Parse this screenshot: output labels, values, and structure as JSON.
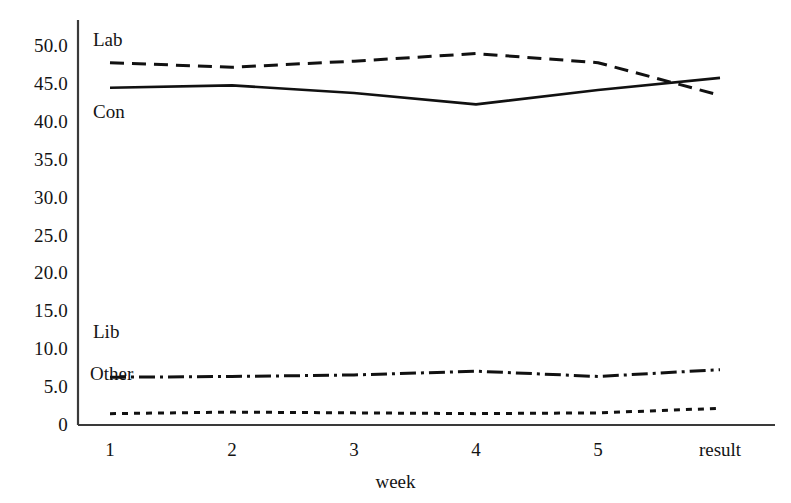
{
  "chart_data": {
    "type": "line",
    "title": "",
    "xlabel": "week",
    "ylabel": "",
    "categories": [
      "1",
      "2",
      "3",
      "4",
      "5",
      "result"
    ],
    "ylim": [
      0,
      50
    ],
    "yticks": [
      "0",
      "5.0",
      "10.0",
      "15.0",
      "20.0",
      "25.0",
      "30.0",
      "35.0",
      "40.0",
      "45.0",
      "50.0"
    ],
    "ytick_values": [
      0,
      5,
      10,
      15,
      20,
      25,
      30,
      35,
      40,
      45,
      50
    ],
    "grid": false,
    "legend_position": "inline-labels",
    "series": [
      {
        "name": "Lab",
        "style": "dashed",
        "color": "#111111",
        "values": [
          47.8,
          47.2,
          48.0,
          49.0,
          47.8,
          43.5
        ]
      },
      {
        "name": "Con",
        "style": "solid",
        "color": "#111111",
        "values": [
          44.5,
          44.8,
          43.8,
          42.3,
          44.2,
          45.8
        ]
      },
      {
        "name": "Lib",
        "style": "dashdot",
        "color": "#111111",
        "values": [
          6.3,
          6.4,
          6.6,
          7.1,
          6.4,
          7.3
        ]
      },
      {
        "name": "Other",
        "style": "dotted",
        "color": "#111111",
        "values": [
          1.5,
          1.7,
          1.6,
          1.5,
          1.6,
          2.2
        ]
      }
    ],
    "annotations": [
      {
        "text": "Lab",
        "series": "Lab",
        "x_px": 93,
        "y_px": 30
      },
      {
        "text": "Con",
        "series": "Con",
        "x_px": 93,
        "y_px": 102
      },
      {
        "text": "Lib",
        "series": "Lib",
        "x_px": 93,
        "y_px": 322
      },
      {
        "text": "Other",
        "series": "Other",
        "x_px": 90,
        "y_px": 364
      }
    ]
  },
  "axes": {
    "x_axis_label": "week",
    "spine_color": "#3a3a3a"
  }
}
